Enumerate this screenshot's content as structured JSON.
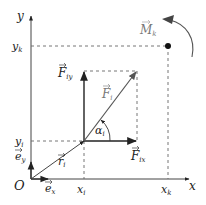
{
  "diagram": {
    "axes": {
      "x_label": "x",
      "y_label": "y",
      "origin_label": "O"
    },
    "unit_vectors": {
      "ex": "e",
      "ex_sub": "x",
      "ey": "e",
      "ey_sub": "y"
    },
    "point_i": {
      "x_label": "x",
      "x_sub": "i",
      "y_label": "y",
      "y_sub": "i"
    },
    "point_k": {
      "x_label": "x",
      "x_sub": "k",
      "y_label": "y",
      "y_sub": "k"
    },
    "position_vector": {
      "label": "r",
      "sub": "i"
    },
    "force": {
      "label": "F",
      "sub": "i"
    },
    "force_x": {
      "label": "F",
      "sub": "ix"
    },
    "force_y": {
      "label": "F",
      "sub": "iy"
    },
    "angle": {
      "label": "α",
      "sub": "i"
    },
    "moment": {
      "label": "M",
      "sub": "k"
    },
    "colors": {
      "axis": "#444444",
      "force": "#666666",
      "dash": "#666666",
      "moment": "#999999"
    }
  }
}
